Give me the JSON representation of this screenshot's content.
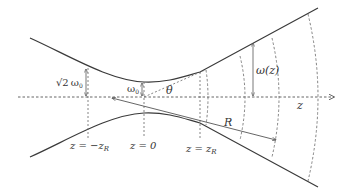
{
  "diagram": {
    "colors": {
      "beam": "#3a3a3a",
      "dashed": "#6a6a6a",
      "text": "#333333"
    },
    "labels": {
      "waist_sqrt2": "√2",
      "waist_sqrt2_omega": "ω",
      "waist_sqrt2_sub": "0",
      "waist_omega": "ω",
      "waist_omega_sub": "0",
      "theta": "θ",
      "omega_z": "ω(z)",
      "z_axis": "z",
      "radius": "R",
      "z_minus_zr_prefix": "z = −z",
      "z_minus_zr_sub": "R",
      "z_zero": "z = 0",
      "z_plus_zr_prefix": "z = z",
      "z_plus_zr_sub": "R"
    },
    "elements": [
      "beam-envelope-upper",
      "beam-envelope-lower",
      "optical-axis-z",
      "rayleigh-range-marker-negative",
      "waist-marker",
      "rayleigh-range-marker-positive",
      "divergence-angle-theta",
      "radius-of-curvature-arrow",
      "wavefront-arcs"
    ]
  }
}
